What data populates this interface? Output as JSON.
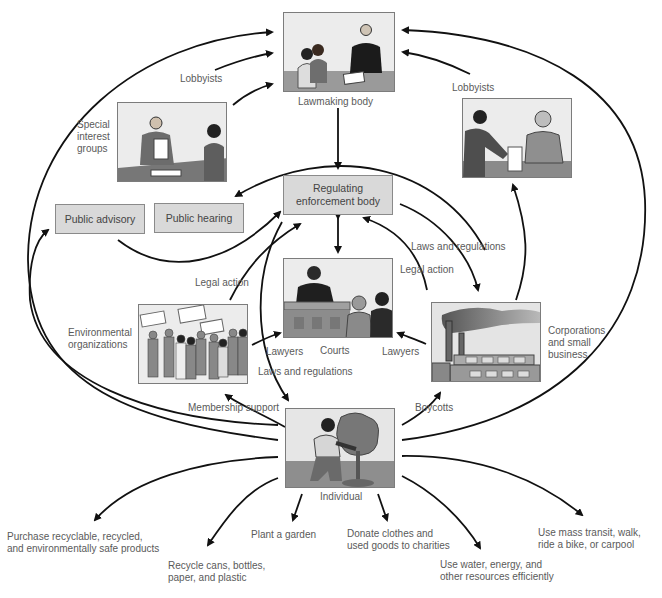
{
  "nodes": {
    "lawmaking_body": {
      "label": "Lawmaking body"
    },
    "regulating_body": {
      "label": "Regulating\nenforcement body"
    },
    "public_advisory": {
      "label": "Public advisory"
    },
    "public_hearing": {
      "label": "Public hearing"
    },
    "courts": {
      "label": "Courts"
    },
    "special_interest": {
      "label": "Special\ninterest\ngroups"
    },
    "environmental_orgs": {
      "label": "Environmental\norganizations"
    },
    "corporations": {
      "label": "Corporations\nand small\nbusiness"
    },
    "individual": {
      "label": "Individual"
    }
  },
  "edge_labels": {
    "lobbyists_left": "Lobbyists",
    "lobbyists_right": "Lobbyists",
    "legal_action_left": "Legal action",
    "legal_action_right": "Legal action",
    "laws_regs_right": "Laws and regulations",
    "laws_regs_bottom": "Laws and regulations",
    "lawyers_left": "Lawyers",
    "lawyers_right": "Lawyers",
    "membership_support": "Membership support",
    "boycotts": "Boycotts"
  },
  "individual_actions": [
    "Purchase recyclable, recycled,\nand environmentally safe products",
    "Recycle cans, bottles,\npaper, and plastic",
    "Plant a garden",
    "Donate clothes and\nused goods to charities",
    "Use water, energy, and\nother resources efficiently",
    "Use mass transit, walk,\nride a bike, or carpool"
  ],
  "colors": {
    "box_fill": "#d9d9d9",
    "box_border": "#8a8a8a",
    "arrow": "#111111",
    "text": "#5a5a5a"
  }
}
